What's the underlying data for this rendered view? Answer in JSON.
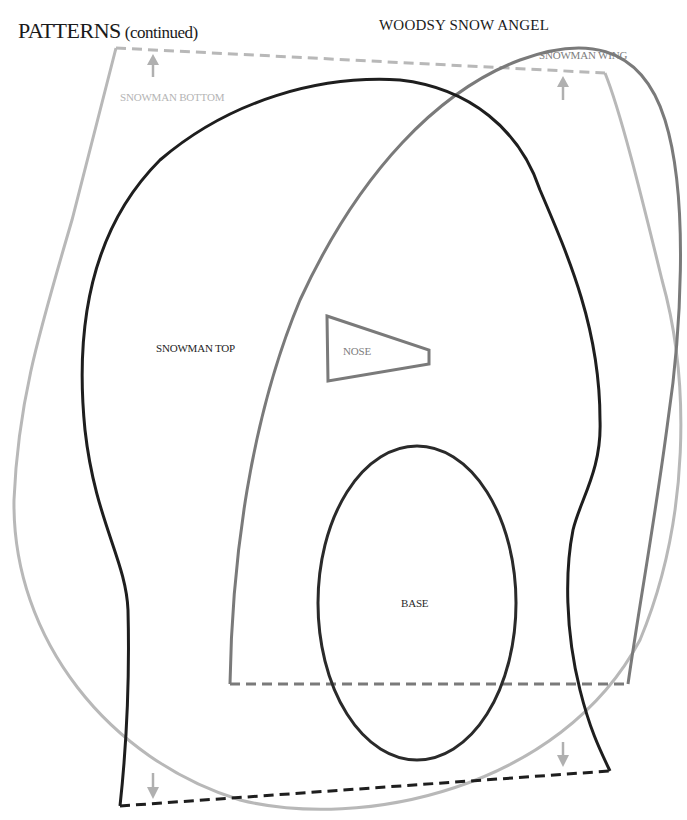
{
  "header": {
    "title": "PATTERNS",
    "title_suffix": "(continued)",
    "project_title": "WOODSY SNOW ANGEL"
  },
  "pieces": {
    "snowman_bottom": {
      "label": "SNOWMAN BOTTOM",
      "color": "#b4b4b4"
    },
    "snowman_wing": {
      "label": "SNOWMAN WING",
      "color": "#7d7d7d"
    },
    "snowman_top": {
      "label": "SNOWMAN TOP",
      "color": "#1e1e1e"
    },
    "nose": {
      "label": "NOSE",
      "color": "#7d7d7d"
    },
    "base": {
      "label": "BASE",
      "color": "#2a2a2a"
    }
  },
  "colors": {
    "background": "#ffffff",
    "black_line": "#1e1e1e",
    "dark_gray_line": "#7a7a7a",
    "light_gray_line": "#b8b8b8"
  }
}
